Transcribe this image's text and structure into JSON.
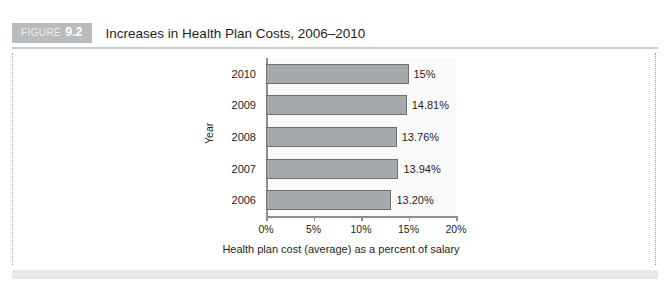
{
  "figure": {
    "badge_word": "FIGURE",
    "badge_number": "9.2",
    "title": "Increases in Health Plan Costs, 2006–2010"
  },
  "chart_data": {
    "type": "bar",
    "orientation": "horizontal",
    "title": "Increases in Health Plan Costs, 2006–2010",
    "xlabel": "Health plan cost (average) as a percent of salary",
    "ylabel": "Year",
    "categories": [
      "2006",
      "2007",
      "2008",
      "2009",
      "2010"
    ],
    "values": [
      13.2,
      13.94,
      13.76,
      14.81,
      15.0
    ],
    "data_labels": [
      "13.20%",
      "13.94%",
      "13.76%",
      "14.81%",
      "15%"
    ],
    "xlim": [
      0,
      20
    ],
    "xticks": [
      0,
      5,
      10,
      15,
      20
    ],
    "xticklabels": [
      "0%",
      "5%",
      "10%",
      "15%",
      "20%"
    ],
    "grid": false,
    "legend": false,
    "bar_fill_color": "#a7aaac",
    "bar_border_color": "#6e7174",
    "plot_background": "#fafafa",
    "axis_color": "#8b8f93"
  }
}
